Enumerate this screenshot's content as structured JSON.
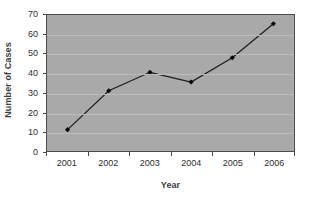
{
  "chart_data": {
    "type": "line",
    "title": "",
    "xlabel": "Year",
    "ylabel": "Number of Cases",
    "categories": [
      "2001",
      "2002",
      "2003",
      "2004",
      "2005",
      "2006"
    ],
    "values": [
      11,
      31,
      40.5,
      35.5,
      48,
      65.5
    ],
    "series": [
      {
        "name": "Number of Cases",
        "values": [
          11,
          31,
          40.5,
          35.5,
          48,
          65.5
        ]
      }
    ],
    "ylim": [
      0,
      70
    ],
    "ytick_labels": [
      "0",
      "10",
      "20",
      "30",
      "40",
      "50",
      "60",
      "70"
    ],
    "ytick_values": [
      0,
      10,
      20,
      30,
      40,
      50,
      60,
      70
    ],
    "ytick_interval": 10,
    "grid": "horizontal",
    "legend": "none",
    "marker": "diamond",
    "colors": {
      "plot_background": "#a9a9a9",
      "plot_border": "#4d4d4d",
      "gridline": "#bcbcbc",
      "series_line": "#1a1a1a",
      "marker_fill": "#000000",
      "text": "#2e2e2e",
      "axis_title": "#3b3b3b",
      "canvas_background": "#ffffff"
    }
  }
}
